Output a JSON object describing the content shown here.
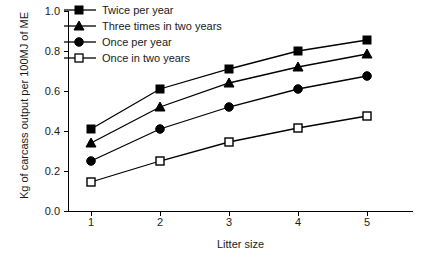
{
  "chart_data": {
    "type": "line",
    "title": "",
    "subtitle": "",
    "xlabel": "Litter size",
    "ylabel": "Kg of carcass output per 100MJ of ME",
    "categories": [
      1,
      2,
      3,
      4,
      5
    ],
    "x": [
      1,
      2,
      3,
      4,
      5
    ],
    "xlim": [
      0.5,
      5.5
    ],
    "ylim": [
      0.0,
      1.0
    ],
    "xtick_labels": [
      "1",
      "2",
      "3",
      "4",
      "5"
    ],
    "ytick_labels": [
      "0.0",
      "0.2",
      "0.4",
      "0.6",
      "0.8",
      "1.0"
    ],
    "ytick_values": [
      0.0,
      0.2,
      0.4,
      0.6,
      0.8,
      1.0
    ],
    "grid": false,
    "legend_position": "top-left",
    "line_color": "#000000",
    "series": [
      {
        "name": "Twice per year",
        "marker": "filled-square",
        "values": [
          0.41,
          0.61,
          0.71,
          0.8,
          0.855
        ]
      },
      {
        "name": "Three times in two years",
        "marker": "filled-triangle",
        "values": [
          0.34,
          0.52,
          0.64,
          0.72,
          0.785
        ]
      },
      {
        "name": "Once per year",
        "marker": "filled-circle",
        "values": [
          0.25,
          0.41,
          0.52,
          0.61,
          0.675
        ]
      },
      {
        "name": "Once in two years",
        "marker": "open-square",
        "values": [
          0.145,
          0.25,
          0.345,
          0.415,
          0.475
        ]
      }
    ]
  },
  "axes": {
    "ylabel": "Kg of carcass output per 100MJ of ME",
    "xlabel": "Litter size",
    "ytick_labels": [
      "1.0",
      "0.8",
      "0.6",
      "0.4",
      "0.2",
      "0.0"
    ],
    "xtick_labels": [
      "1",
      "2",
      "3",
      "4",
      "5"
    ]
  },
  "legend": {
    "items": [
      {
        "label": "Twice per year",
        "marker": "filled-square"
      },
      {
        "label": "Three times in two years",
        "marker": "filled-triangle"
      },
      {
        "label": "Once per year",
        "marker": "filled-circle"
      },
      {
        "label": "Once in two years",
        "marker": "open-square"
      }
    ]
  }
}
